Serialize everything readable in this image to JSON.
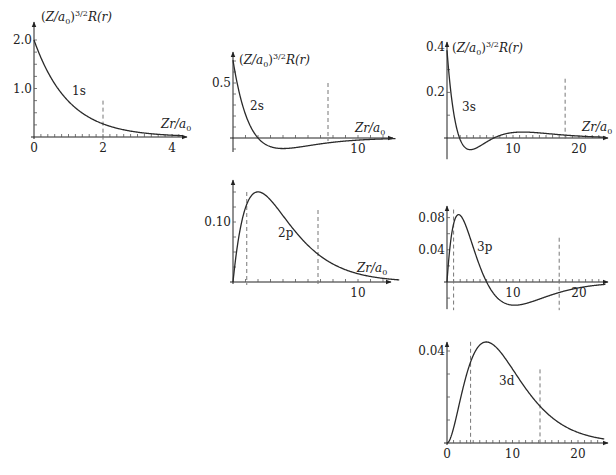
{
  "chart_data": [
    {
      "id": "1s",
      "type": "line",
      "title": "",
      "curve_label": "1s",
      "ylabel": "(Z/a0)^{3/2} R(r)",
      "xlabel": "Zr/a0",
      "xlim": [
        0,
        4.3
      ],
      "ylim": [
        0,
        2.0
      ],
      "xticks_labeled": [
        "0",
        "2",
        "4"
      ],
      "yticks_labeled": [
        "1.0",
        "2.0"
      ],
      "dashed_lines_x": [
        2
      ],
      "x": [
        0,
        0.5,
        1,
        1.5,
        2,
        2.5,
        3,
        3.5,
        4
      ],
      "y": [
        2.0,
        1.21,
        0.74,
        0.45,
        0.27,
        0.16,
        0.1,
        0.06,
        0.04
      ]
    },
    {
      "id": "2s",
      "type": "line",
      "title": "",
      "curve_label": "2s",
      "ylabel": "(Z/a0)^{3/2} R(r)",
      "xlabel": "Zr/a0",
      "xlim": [
        0,
        13.5
      ],
      "ylim": [
        -0.1,
        0.707
      ],
      "xticks_labeled": [
        "10"
      ],
      "yticks_labeled": [
        "0.5"
      ],
      "dashed_lines_x": [
        7.6
      ],
      "x": [
        0,
        1,
        2,
        3,
        4,
        6,
        8,
        10,
        12
      ],
      "y": [
        0.707,
        0.214,
        0,
        -0.079,
        -0.096,
        -0.08,
        -0.055,
        -0.034,
        -0.02
      ]
    },
    {
      "id": "3s",
      "type": "line",
      "title": "",
      "curve_label": "3s",
      "ylabel": "(Z/a0)^{3/2} R(r)",
      "xlabel": "Zr/a0",
      "xlim": [
        0,
        24
      ],
      "ylim": [
        -0.08,
        0.385
      ],
      "xticks_labeled": [
        "10",
        "20"
      ],
      "yticks_labeled": [
        "0.2",
        "0.4"
      ],
      "dashed_lines_x": [
        18
      ],
      "x": [
        0,
        1,
        1.9,
        3,
        4,
        7.1,
        10,
        12,
        15,
        20,
        24
      ],
      "y": [
        0.385,
        0.15,
        0,
        -0.054,
        -0.06,
        0,
        0.018,
        0.021,
        0.017,
        0.008,
        0.003
      ]
    },
    {
      "id": "2p",
      "type": "line",
      "title": "",
      "curve_label": "2p",
      "ylabel": "",
      "xlabel": "Zr/a0",
      "xlim": [
        0,
        13.5
      ],
      "ylim": [
        0,
        0.15
      ],
      "xticks_labeled": [
        "10"
      ],
      "yticks_labeled": [
        "0.10"
      ],
      "dashed_lines_x": [
        1.0,
        6.8
      ],
      "x": [
        0,
        1,
        2,
        3,
        4,
        6,
        8,
        10,
        12
      ],
      "y": [
        0,
        0.124,
        0.15,
        0.136,
        0.11,
        0.061,
        0.03,
        0.014,
        0.006
      ]
    },
    {
      "id": "3p",
      "type": "line",
      "title": "",
      "curve_label": "3p",
      "ylabel": "",
      "xlabel": "",
      "xlim": [
        0,
        24
      ],
      "ylim": [
        -0.03,
        0.084
      ],
      "xticks_labeled": [
        "10",
        "20"
      ],
      "yticks_labeled": [
        "0.04",
        "0.08"
      ],
      "dashed_lines_x": [
        1.0,
        17
      ],
      "x": [
        0,
        1,
        2,
        3,
        4,
        6,
        8,
        10,
        12,
        16,
        20,
        24
      ],
      "y": [
        0,
        0.067,
        0.084,
        0.071,
        0.047,
        0,
        -0.025,
        -0.03,
        -0.027,
        -0.017,
        -0.008,
        -0.004
      ]
    },
    {
      "id": "3d",
      "type": "line",
      "title": "",
      "curve_label": "3d",
      "ylabel": "",
      "xlabel": "",
      "xlim": [
        0,
        24
      ],
      "ylim": [
        0,
        0.045
      ],
      "xticks_labeled": [
        "0",
        "10",
        "20"
      ],
      "yticks_labeled": [
        "0.04"
      ],
      "dashed_lines_x": [
        3.6,
        14.2
      ],
      "x": [
        0,
        2,
        4,
        6,
        8,
        10,
        12,
        14,
        16,
        18,
        20,
        24
      ],
      "y": [
        0,
        0.0213,
        0.0376,
        0.0427,
        0.0398,
        0.0331,
        0.0257,
        0.0189,
        0.0134,
        0.0092,
        0.0061,
        0.0026
      ]
    }
  ],
  "labels": {
    "ylabel_main": "(Z/a",
    "ylabel_sub": "0",
    "ylabel_sup": ")",
    "ylabel_exp": "3/2",
    "ylabel_tail": "R(r)",
    "xlabel_main": "Zr/a",
    "xlabel_sub": "0"
  },
  "panels": [
    {
      "id": "1s",
      "ox": 34,
      "oy": 137,
      "px_per_x": 34.5,
      "px_per_y": 48.5,
      "xmax_px": 187,
      "ytop_px": 22,
      "minor_x": 0.2,
      "minor_y": 0.25,
      "xtick_labels": [
        {
          "v": 0,
          "t": "0"
        },
        {
          "v": 2,
          "t": "2"
        },
        {
          "v": 4,
          "t": "4"
        }
      ],
      "ytick_labels": [
        {
          "v": 1.0,
          "t": "1.0"
        },
        {
          "v": 2.0,
          "t": "2.0"
        }
      ],
      "dash": [
        {
          "x": 2,
          "ytop": 0.75
        }
      ],
      "fn": "R10",
      "xmax": 4.3,
      "curve_label": {
        "t": "1s",
        "x": 72,
        "y": 95
      },
      "ylabel": {
        "x": 41,
        "y": 21
      },
      "xlabel": {
        "x": 161,
        "y": 128
      }
    },
    {
      "id": "2s",
      "ox": 233,
      "oy": 138,
      "px_per_x": 12.5,
      "px_per_y": 110,
      "xmax_px": 393,
      "ytop_px": 52,
      "minor_x": 1,
      "minor_y": 0.1,
      "xtick_labels": [
        {
          "v": 10,
          "t": "10"
        }
      ],
      "ytick_labels": [
        {
          "v": 0.5,
          "t": "0.5"
        }
      ],
      "dash": [
        {
          "x": 7.6,
          "ytop": 0.5
        }
      ],
      "fn": "R20",
      "xmax": 13,
      "curve_label": {
        "t": "2s",
        "x": 250,
        "y": 110
      },
      "ylabel": {
        "x": 239,
        "y": 64
      },
      "xlabel": {
        "x": 355,
        "y": 132
      }
    },
    {
      "id": "3s",
      "ox": 447,
      "oy": 138,
      "px_per_x": 6.6,
      "px_per_y": 228,
      "xmax_px": 608,
      "ytop_px": 42,
      "minor_x": 1,
      "minor_y": 0.1,
      "xtick_labels": [
        {
          "v": 10,
          "t": "10"
        },
        {
          "v": 20,
          "t": "20"
        }
      ],
      "ytick_labels": [
        {
          "v": 0.2,
          "t": "0.2"
        },
        {
          "v": 0.4,
          "t": "0.4"
        }
      ],
      "dash": [
        {
          "x": 17.9,
          "ytop": 0.26
        }
      ],
      "fn": "R30",
      "xmax": 24,
      "curve_label": {
        "t": "3s",
        "x": 462,
        "y": 111
      },
      "ylabel": {
        "x": 452,
        "y": 52
      },
      "xlabel": {
        "x": 582,
        "y": 131
      }
    },
    {
      "id": "2p",
      "ox": 233,
      "oy": 282,
      "px_per_x": 12.5,
      "px_per_y": 600,
      "xmax_px": 391,
      "ytop_px": 180,
      "minor_x": 1,
      "minor_y": 0.025,
      "xtick_labels": [
        {
          "v": 10,
          "t": "10"
        }
      ],
      "ytick_labels": [
        {
          "v": 0.1,
          "t": "0.10"
        }
      ],
      "dash": [
        {
          "x": 1.1,
          "ytop": 0.15
        },
        {
          "x": 6.8,
          "ytop": 0.12
        }
      ],
      "fn": "R21",
      "xmax": 13.3,
      "curve_label": {
        "t": "2p",
        "x": 278,
        "y": 237
      },
      "ylabel": null,
      "xlabel": {
        "x": 357,
        "y": 272
      }
    },
    {
      "id": "3p",
      "ox": 447,
      "oy": 282,
      "px_per_x": 6.6,
      "px_per_y": 805,
      "xmax_px": 608,
      "ytop_px": 206,
      "minor_x": 1,
      "minor_y": 0.02,
      "xtick_labels": [
        {
          "v": 10,
          "t": "10"
        },
        {
          "v": 20,
          "t": "20"
        }
      ],
      "ytick_labels": [
        {
          "v": 0.04,
          "t": "0.04"
        },
        {
          "v": 0.08,
          "t": "0.08"
        }
      ],
      "dash": [
        {
          "x": 1.0,
          "ytop": 0.09,
          "ybot": -0.035
        },
        {
          "x": 17,
          "ytop": 0.055,
          "ybot": -0.035
        }
      ],
      "fn": "R31",
      "xmax": 24,
      "curve_label": {
        "t": "3p",
        "x": 477,
        "y": 251
      },
      "ylabel": null,
      "xlabel": null
    },
    {
      "id": "3d",
      "ox": 447,
      "oy": 443,
      "px_per_x": 6.55,
      "px_per_y": 2300,
      "xmax_px": 608,
      "ytop_px": 342,
      "minor_x": 1,
      "minor_y": 0.01,
      "xtick_labels": [
        {
          "v": 0,
          "t": "0"
        },
        {
          "v": 10,
          "t": "10"
        },
        {
          "v": 20,
          "t": "20"
        }
      ],
      "ytick_labels": [
        {
          "v": 0.04,
          "t": "0.04"
        }
      ],
      "dash": [
        {
          "x": 3.6,
          "ytop": 0.044
        },
        {
          "x": 14.2,
          "ytop": 0.032
        }
      ],
      "fn": "R32",
      "xmax": 24,
      "curve_label": {
        "t": "3d",
        "x": 499,
        "y": 385
      },
      "ylabel": null,
      "xlabel": null
    }
  ]
}
